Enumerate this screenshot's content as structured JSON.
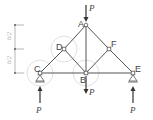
{
  "diagram": {
    "type": "truss",
    "colors": {
      "member": "#555555",
      "load": "#333333",
      "highlight_circle": "#d8d8d8",
      "dimension": "#888888"
    },
    "nodes": [
      {
        "id": "A",
        "label": "A",
        "x": 86,
        "y": 25
      },
      {
        "id": "D",
        "label": "D",
        "x": 64,
        "y": 49
      },
      {
        "id": "F",
        "label": "F",
        "x": 109,
        "y": 49
      },
      {
        "id": "C",
        "label": "C",
        "x": 40,
        "y": 73
      },
      {
        "id": "B",
        "label": "B",
        "x": 86,
        "y": 73
      },
      {
        "id": "E",
        "label": "E",
        "x": 133,
        "y": 73
      }
    ],
    "members": [
      [
        "C",
        "D"
      ],
      [
        "D",
        "A"
      ],
      [
        "A",
        "F"
      ],
      [
        "F",
        "E"
      ],
      [
        "C",
        "B"
      ],
      [
        "B",
        "E"
      ],
      [
        "A",
        "B"
      ],
      [
        "D",
        "B"
      ],
      [
        "F",
        "B"
      ]
    ],
    "loads": [
      {
        "at": "A",
        "label": "P",
        "direction": "down"
      },
      {
        "at": "B",
        "label": "P",
        "direction": "down"
      },
      {
        "at": "C",
        "label": "P",
        "direction": "up",
        "type": "reaction"
      },
      {
        "at": "E",
        "label": "P",
        "direction": "up",
        "type": "reaction"
      }
    ],
    "supports": [
      {
        "at": "C",
        "type": "pin"
      },
      {
        "at": "E",
        "type": "pin"
      }
    ],
    "highlighted_joints": [
      "D",
      "C",
      "B"
    ],
    "dimensions": [
      {
        "label": "h/2"
      },
      {
        "label": "h/2"
      }
    ]
  },
  "labels": {
    "A": "A",
    "B": "B",
    "C": "C",
    "D": "D",
    "E": "E",
    "F": "F",
    "P_top": "P",
    "P_bottom": "P",
    "P_left": "P",
    "P_right": "P",
    "dim_upper": "h/2",
    "dim_lower": "h/2"
  }
}
